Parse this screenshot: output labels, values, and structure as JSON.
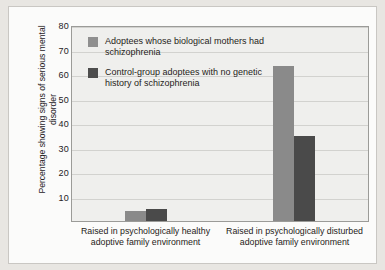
{
  "chart_data": {
    "type": "bar",
    "title": "",
    "subtitle": "",
    "xlabel": "",
    "ylabel": "Percentage showing signs of serious mental disorder",
    "ylim": [
      0,
      80
    ],
    "yticks": [
      80,
      70,
      60,
      50,
      40,
      30,
      20,
      10
    ],
    "grid": true,
    "legend_position": "inside-top-left",
    "categories": [
      "Raised in psychologically healthy adoptive family environment",
      "Raised in psychologically disturbed adoptive family environment"
    ],
    "series": [
      {
        "name": "Adoptees whose biological mothers had schizophrenia",
        "color": "#8a8a8a",
        "values": [
          4,
          64
        ]
      },
      {
        "name": "Control-group adoptees with no genetic history of schizophrenia",
        "color": "#4a4a4a",
        "values": [
          5,
          35
        ]
      }
    ]
  },
  "legend": {
    "items": [
      {
        "label": "Adoptees whose biological mothers had schizophrenia",
        "swatch": "light"
      },
      {
        "label": "Control-group adoptees with no genetic history of schizophrenia",
        "swatch": "dark"
      }
    ]
  },
  "colors": {
    "light_bar": "#8a8a8a",
    "dark_bar": "#4a4a4a",
    "plot_background": "#efefed",
    "page_background": "#e8e6e2",
    "frame_background": "#fbfbfa",
    "gridline": "#d2d2cf"
  }
}
